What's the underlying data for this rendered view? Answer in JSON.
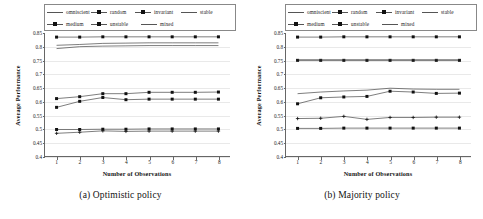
{
  "figure": {
    "ylabel": "Average Performance",
    "xlabel": "Number of Observations",
    "legend_labels": [
      "omniscient",
      "random",
      "invariant",
      "stable",
      "medium",
      "unstable",
      "mixed"
    ]
  },
  "chart_data": [
    {
      "type": "line",
      "panel": "a",
      "caption": "(a) Optimistic policy",
      "title": "",
      "xlabel": "Number of Observations",
      "ylabel": "Average Performance",
      "x": [
        1,
        2,
        3,
        4,
        5,
        6,
        7,
        8
      ],
      "xticklabels": [
        "1",
        "2",
        "3",
        "4",
        "5",
        "6",
        "7",
        "8"
      ],
      "yticklabels": [
        "0.85",
        "0.8",
        "0.75",
        "0.7",
        "0.65",
        "0.6",
        "0.55",
        "0.5",
        "0.45",
        "0.4"
      ],
      "ylim": [
        0.4,
        0.85
      ],
      "xlim": [
        0.5,
        8.5
      ],
      "grid": true,
      "legend_position": "above-plot",
      "series": [
        {
          "name": "omniscient",
          "marker": "line",
          "values": [
            0.835,
            0.835,
            0.836,
            0.836,
            0.836,
            0.836,
            0.836,
            0.836
          ]
        },
        {
          "name": "random",
          "marker": "square",
          "values": [
            0.497,
            0.497,
            0.498,
            0.498,
            0.499,
            0.499,
            0.499,
            0.499
          ]
        },
        {
          "name": "invariant",
          "marker": "square",
          "values": [
            0.578,
            0.6,
            0.614,
            0.606,
            0.608,
            0.608,
            0.608,
            0.608
          ]
        },
        {
          "name": "stable",
          "marker": "none",
          "values": [
            0.805,
            0.808,
            0.812,
            0.813,
            0.814,
            0.814,
            0.814,
            0.814
          ]
        },
        {
          "name": "medium",
          "marker": "square",
          "values": [
            0.61,
            0.617,
            0.628,
            0.628,
            0.633,
            0.633,
            0.633,
            0.634
          ]
        },
        {
          "name": "unstable",
          "marker": "plus",
          "values": [
            0.483,
            0.487,
            0.492,
            0.49,
            0.491,
            0.491,
            0.491,
            0.491
          ]
        },
        {
          "name": "mixed",
          "marker": "none",
          "values": [
            0.793,
            0.8,
            0.802,
            0.803,
            0.804,
            0.804,
            0.804,
            0.804
          ]
        }
      ]
    },
    {
      "type": "line",
      "panel": "b",
      "caption": "(b) Majority policy",
      "title": "",
      "xlabel": "Number of Observations",
      "ylabel": "Average Performance",
      "x": [
        1,
        2,
        3,
        4,
        5,
        6,
        7,
        8
      ],
      "xticklabels": [
        "1",
        "2",
        "3",
        "4",
        "5",
        "6",
        "7",
        "8"
      ],
      "yticklabels": [
        "0.85",
        "0.8",
        "0.75",
        "0.7",
        "0.65",
        "0.6",
        "0.55",
        "0.5",
        "0.45",
        "0.4"
      ],
      "ylim": [
        0.4,
        0.85
      ],
      "xlim": [
        0.5,
        8.5
      ],
      "grid": true,
      "legend_position": "above-plot",
      "series": [
        {
          "name": "omniscient",
          "marker": "line",
          "values": [
            0.835,
            0.835,
            0.836,
            0.836,
            0.836,
            0.836,
            0.836,
            0.836
          ]
        },
        {
          "name": "random",
          "marker": "square",
          "values": [
            0.501,
            0.501,
            0.502,
            0.502,
            0.502,
            0.502,
            0.502,
            0.502
          ]
        },
        {
          "name": "invariant",
          "marker": "square",
          "values": [
            0.75,
            0.75,
            0.75,
            0.75,
            0.75,
            0.75,
            0.75,
            0.75
          ]
        },
        {
          "name": "stable",
          "marker": "none",
          "values": [
            0.752,
            0.752,
            0.752,
            0.752,
            0.752,
            0.752,
            0.752,
            0.752
          ]
        },
        {
          "name": "medium",
          "marker": "square",
          "values": [
            0.591,
            0.613,
            0.616,
            0.618,
            0.637,
            0.634,
            0.629,
            0.63
          ]
        },
        {
          "name": "unstable",
          "marker": "plus",
          "values": [
            0.537,
            0.538,
            0.545,
            0.534,
            0.541,
            0.541,
            0.542,
            0.542
          ]
        },
        {
          "name": "mixed",
          "marker": "none",
          "values": [
            0.628,
            0.634,
            0.638,
            0.641,
            0.648,
            0.645,
            0.644,
            0.644
          ]
        }
      ]
    }
  ]
}
